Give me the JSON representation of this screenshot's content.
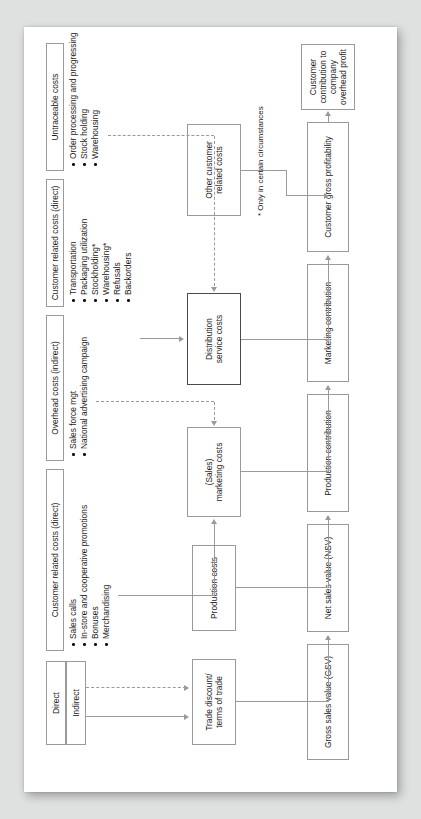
{
  "document": {
    "title": "Customer profitability analysis flowchart",
    "orientation": "landscape-rotated",
    "footnote": "* Only in certain circumstances"
  },
  "legend": {
    "direct_label": "Direct",
    "indirect_label": "Indirect"
  },
  "cost_groups": [
    {
      "id": "customer-related-direct-marketing",
      "title": "Customer related costs (direct)",
      "items": [
        "Sales calls",
        "In-store and cooperative promotions",
        "Bonuses",
        "Merchandising"
      ]
    },
    {
      "id": "overhead-indirect",
      "title": "Overhead costs (indirect)",
      "items": [
        "Sales force mgt",
        "National advertising campaign"
      ]
    },
    {
      "id": "customer-related-direct-distribution",
      "title": "Customer related costs (direct)",
      "items": [
        "Transportation",
        "Packaging utilization",
        "Stockholding*",
        "Warehousing*",
        "Refusals",
        "Backorders"
      ]
    },
    {
      "id": "untraceable",
      "title": "Untraceable costs",
      "items": [
        "Order processing and progressing",
        "Stock holding",
        "Warehousing"
      ]
    }
  ],
  "cost_boxes": [
    {
      "id": "trade-discount",
      "label": "Trade discount/\nterms of trade"
    },
    {
      "id": "production-costs",
      "label": "Production costs"
    },
    {
      "id": "marketing-costs",
      "label": "(Sales)\nmarketing costs"
    },
    {
      "id": "distribution-costs",
      "label": "Distribution\nservice costs"
    },
    {
      "id": "other-customer-costs",
      "label": "Other customer\nrelated costs"
    }
  ],
  "flow_boxes": [
    {
      "id": "gsv",
      "label": "Gross sales value (GSV)"
    },
    {
      "id": "nsv",
      "label": "Net sales value (NSV)"
    },
    {
      "id": "production-contrib",
      "label": "Production contribution"
    },
    {
      "id": "marketing-contrib",
      "label": "Marketing contribution"
    },
    {
      "id": "customer-gross-profit",
      "label": "Customer gross profitability"
    },
    {
      "id": "customer-contrib",
      "label": "Customer contribution to\ncompany overhead profit"
    }
  ],
  "colors": {
    "page_background": "#dfe0e0",
    "sheet": "#ffffff",
    "line": "#9a9a9a",
    "text": "#1a1a1a",
    "emphasis_border": "#4a4a4a"
  }
}
